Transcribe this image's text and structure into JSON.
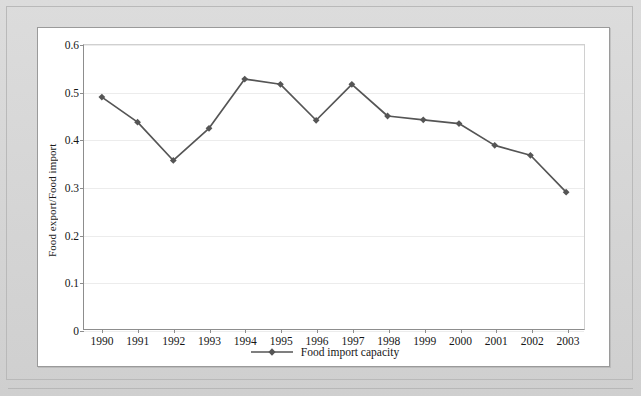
{
  "figure": {
    "background_color": "#ffffff",
    "page_color": "#d9d9d9",
    "series_color": "#555555"
  },
  "axes": {
    "ylabel": "Food export/Food import",
    "xlabel": "",
    "yticks": [
      "0",
      "0.1",
      "0.2",
      "0.3",
      "0.4",
      "0.5",
      "0.6"
    ],
    "ylim": [
      0,
      0.6
    ]
  },
  "legend": {
    "position": "bottom-center",
    "entries": [
      {
        "label": "Food import capacity",
        "marker": "diamond",
        "color": "#555555"
      }
    ]
  },
  "chart_data": {
    "type": "line",
    "title": "",
    "xlabel": "",
    "ylabel": "Food export/Food import",
    "ylim": [
      0,
      0.6
    ],
    "grid": true,
    "legend_position": "bottom-center",
    "categories": [
      "1990",
      "1991",
      "1992",
      "1993",
      "1994",
      "1995",
      "1996",
      "1997",
      "1998",
      "1999",
      "2000",
      "2001",
      "2002",
      "2003"
    ],
    "series": [
      {
        "name": "Food import capacity",
        "color": "#555555",
        "marker": "diamond",
        "values": [
          0.49,
          0.437,
          0.356,
          0.424,
          0.528,
          0.517,
          0.441,
          0.517,
          0.45,
          0.442,
          0.434,
          0.388,
          0.367,
          0.289
        ]
      }
    ]
  }
}
